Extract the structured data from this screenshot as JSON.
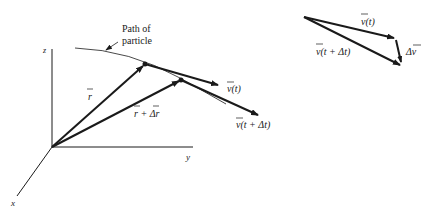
{
  "diagram": {
    "left": {
      "axes": {
        "z": "z",
        "y": "y",
        "x": "x"
      },
      "path_label_line1": "Path of",
      "path_label_line2": "particle",
      "r_label": "r",
      "r_plus_dr_label": "r + Δr",
      "v_t_label": "v(t)",
      "v_t_dt_label": "v(t + Δt)"
    },
    "right": {
      "v_t_label": "v(t)",
      "v_t_dt_label": "v(t + Δt)",
      "dv_label": "Δv"
    },
    "colors": {
      "ink": "#1a1a1a",
      "background": "#ffffff"
    }
  }
}
